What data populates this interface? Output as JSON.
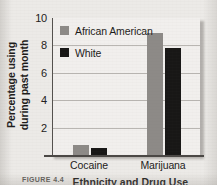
{
  "chart_data": {
    "type": "bar",
    "title": "",
    "xlabel": "",
    "ylabel_line1": "Percentage using",
    "ylabel_line2": "during past month",
    "categories": [
      "Cocaine",
      "Marijuana"
    ],
    "series": [
      {
        "name": "African American",
        "color": "#8d8a87",
        "values": [
          0.7,
          8.9
        ]
      },
      {
        "name": "White",
        "color": "#181716",
        "values": [
          0.5,
          7.8
        ]
      }
    ],
    "ylim": [
      0,
      10
    ],
    "yticks": [
      10,
      8,
      6,
      4,
      2
    ],
    "ytick_labels": [
      "10",
      "8",
      "6",
      "4",
      "2"
    ],
    "grid": true,
    "legend_position": "top-left-inside"
  },
  "legend": {
    "items": [
      {
        "label": "African American",
        "swatch": "#8d8a87"
      },
      {
        "label": "White",
        "swatch": "#181716"
      }
    ]
  },
  "caption": {
    "figure_number": "FIGURE 4.4",
    "title": "Ethnicity and Drug Use"
  },
  "colors": {
    "african_american_bar": "#8d8a87",
    "white_bar": "#181716",
    "plot_background": "#f1efed",
    "page_background": "#eceae7",
    "gridline": "#b9b6b2",
    "axis": "#4b4845"
  }
}
